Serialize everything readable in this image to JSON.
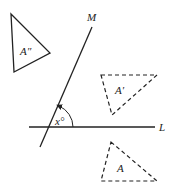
{
  "diagram": {
    "lines": {
      "L": {
        "label": "L"
      },
      "M": {
        "label": "M"
      }
    },
    "angle": {
      "label": "x°"
    },
    "triangles": {
      "A": {
        "label": "A",
        "style": "dashed"
      },
      "A_prime": {
        "label": "A′",
        "style": "dashed"
      },
      "A_double_prime": {
        "label": "A″",
        "style": "solid"
      }
    },
    "colors": {
      "stroke": "#222222",
      "background": "#ffffff"
    }
  }
}
